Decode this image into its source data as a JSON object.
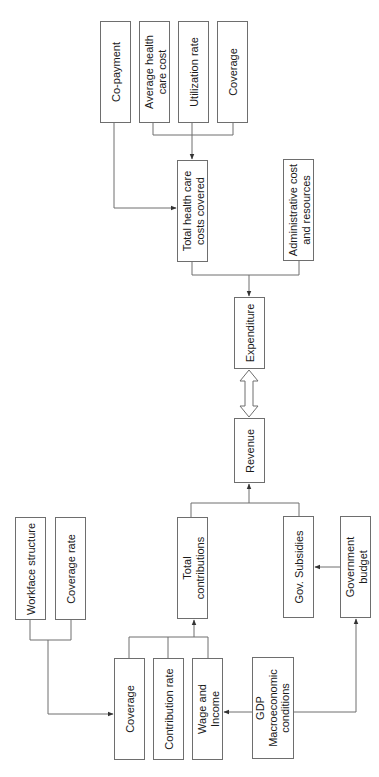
{
  "diagram": {
    "colors": {
      "line": "#6e6e6e",
      "text": "#1a1a1a",
      "background": "#ffffff"
    },
    "nodes": {
      "co_payment": {
        "label": "Co-payment",
        "x": 100,
        "y": 21,
        "w": 31,
        "h": 102
      },
      "avg_health_care_cost": {
        "label": "Average health\ncare cost",
        "x": 139,
        "y": 21,
        "w": 31,
        "h": 102
      },
      "utilization_rate": {
        "label": "Utilization rate",
        "x": 178,
        "y": 21,
        "w": 31,
        "h": 102
      },
      "coverage_top": {
        "label": "Coverage",
        "x": 217,
        "y": 21,
        "w": 31,
        "h": 102
      },
      "total_health_costs": {
        "label": "Total health care\ncosts covered",
        "x": 177,
        "y": 160,
        "w": 31,
        "h": 102
      },
      "admin_cost": {
        "label": "Administrative cost\nand resources",
        "x": 283,
        "y": 159,
        "w": 31,
        "h": 102
      },
      "expenditure": {
        "label": "Expenditure",
        "x": 234,
        "y": 297,
        "w": 31,
        "h": 72
      },
      "revenue": {
        "label": "Revenue",
        "x": 234,
        "y": 418,
        "w": 31,
        "h": 65
      },
      "total_contributions": {
        "label": "Total\ncontributions",
        "x": 177,
        "y": 517,
        "w": 31,
        "h": 102
      },
      "gov_subsidies": {
        "label": "Gov. Subsidies",
        "x": 283,
        "y": 516,
        "w": 31,
        "h": 102
      },
      "government_budget": {
        "label": "Government\nbudget",
        "x": 340,
        "y": 516,
        "w": 31,
        "h": 102
      },
      "workface_structure": {
        "label": "Workface structure",
        "x": 15,
        "y": 517,
        "w": 31,
        "h": 103
      },
      "coverage_rate": {
        "label": "Coverage rate",
        "x": 55,
        "y": 517,
        "w": 31,
        "h": 103
      },
      "coverage_bottom": {
        "label": "Coverage",
        "x": 114,
        "y": 658,
        "w": 31,
        "h": 102
      },
      "contribution_rate": {
        "label": "Contribution rate",
        "x": 153,
        "y": 658,
        "w": 31,
        "h": 102
      },
      "wage_income": {
        "label": "Wage and\nIncome",
        "x": 192,
        "y": 658,
        "w": 31,
        "h": 102
      },
      "gdp_macro": {
        "label": "GDP\nMacroeconomic\nconditions",
        "x": 252,
        "y": 657,
        "w": 42,
        "h": 102
      }
    },
    "edges": [
      {
        "from": [
          "avg_health_care_cost",
          "utilization_rate",
          "coverage_top"
        ],
        "to": "total_health_costs",
        "type": "merge-arrow"
      },
      {
        "from": [
          "co_payment"
        ],
        "to": "total_health_costs",
        "type": "elbow-arrow"
      },
      {
        "from": [
          "total_health_costs",
          "admin_cost"
        ],
        "to": "expenditure",
        "type": "merge-arrow"
      },
      {
        "from": [
          "expenditure"
        ],
        "to": "revenue",
        "type": "double-hollow-arrow"
      },
      {
        "from": [
          "total_contributions",
          "gov_subsidies"
        ],
        "to": "revenue",
        "type": "merge-arrow"
      },
      {
        "from": [
          "government_budget"
        ],
        "to": "gov_subsidies",
        "type": "arrow"
      },
      {
        "from": [
          "workface_structure",
          "coverage_rate"
        ],
        "to": "coverage_bottom",
        "type": "merge-elbow-arrow"
      },
      {
        "from": [
          "coverage_bottom",
          "contribution_rate",
          "wage_income"
        ],
        "to": "total_contributions",
        "type": "merge-arrow"
      },
      {
        "from": [
          "gdp_macro"
        ],
        "to": "wage_income",
        "type": "arrow"
      },
      {
        "from": [
          "gdp_macro"
        ],
        "to": "government_budget",
        "type": "elbow-arrow"
      }
    ]
  }
}
